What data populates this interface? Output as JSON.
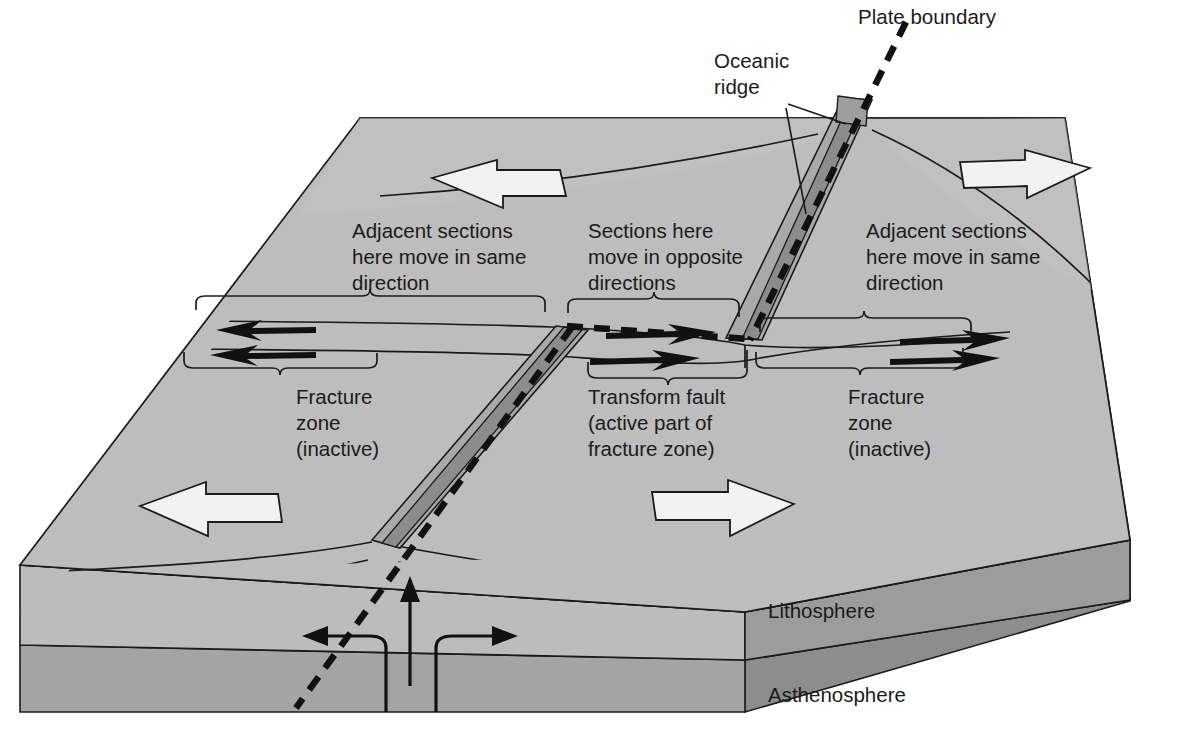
{
  "figure": {
    "type": "block-diagram",
    "background_color": "#ffffff"
  },
  "colors": {
    "top_surface": "#b9b9b9",
    "top_surface_light": "#c4c4c4",
    "lithosphere_front": "#c0c0c0",
    "asthenosphere_front": "#a6a6a6",
    "side_face_lithosphere": "#9a9a9a",
    "side_face_asthenosphere": "#8a8a8a",
    "rift_valley": "#8f8f8f",
    "ridge_flank": "#a8a8a8",
    "outline": "#1b1b1b",
    "white_arrow_fill": "#f2f2f2",
    "black_arrow": "#111111",
    "dashed_boundary": "#111111",
    "text": "#1b1b1b"
  },
  "labels": {
    "plate_boundary": "Plate boundary",
    "oceanic_ridge": [
      "Oceanic",
      "ridge"
    ],
    "adjacent_left": [
      "Adjacent sections",
      "here move in same",
      "direction"
    ],
    "sections_center": [
      "Sections here",
      "move in opposite",
      "directions"
    ],
    "adjacent_right": [
      "Adjacent sections",
      "here move in same",
      "direction"
    ],
    "fracture_zone_left": [
      "Fracture",
      "zone",
      "(inactive)"
    ],
    "transform_fault": [
      "Transform fault",
      "(active part of",
      "fracture zone)"
    ],
    "fracture_zone_right": [
      "Fracture",
      "zone",
      "(inactive)"
    ],
    "lithosphere": "Lithosphere",
    "asthenosphere": "Asthenosphere"
  },
  "annotations": {
    "leader_lines": [
      {
        "name": "oceanic-ridge-leader-upper",
        "from": "oceanic ridge label",
        "to": "upper ridge crest"
      },
      {
        "name": "oceanic-ridge-leader-lower",
        "from": "oceanic ridge label",
        "to": "rift valley"
      }
    ],
    "braces": [
      {
        "name": "brace-adjacent-left",
        "label": "adjacent_left"
      },
      {
        "name": "brace-sections-center",
        "label": "sections_center"
      },
      {
        "name": "brace-adjacent-right",
        "label": "adjacent_right"
      },
      {
        "name": "brace-fracture-left",
        "label": "fracture_zone_left"
      },
      {
        "name": "brace-transform",
        "label": "transform_fault"
      },
      {
        "name": "brace-fracture-right",
        "label": "fracture_zone_right"
      }
    ]
  },
  "motion": {
    "plate_arrows": [
      {
        "name": "plate-arrow-top-left",
        "direction": "left"
      },
      {
        "name": "plate-arrow-top-right",
        "direction": "right"
      },
      {
        "name": "plate-arrow-bottom-left",
        "direction": "left"
      },
      {
        "name": "plate-arrow-bottom-right",
        "direction": "right"
      }
    ],
    "fault_arrows": [
      {
        "name": "fault-arrow-left-upper",
        "direction": "left"
      },
      {
        "name": "fault-arrow-left-lower",
        "direction": "left"
      },
      {
        "name": "fault-arrow-center-upper",
        "direction": "right"
      },
      {
        "name": "fault-arrow-center-lower",
        "direction": "right"
      },
      {
        "name": "fault-arrow-right-upper",
        "direction": "right"
      },
      {
        "name": "fault-arrow-right-lower",
        "direction": "right"
      }
    ],
    "mantle_flow": [
      {
        "name": "mantle-upwelling-arrow",
        "direction": "up"
      },
      {
        "name": "mantle-divergence-arrow-left",
        "direction": "left"
      },
      {
        "name": "mantle-divergence-arrow-right",
        "direction": "right"
      }
    ]
  }
}
